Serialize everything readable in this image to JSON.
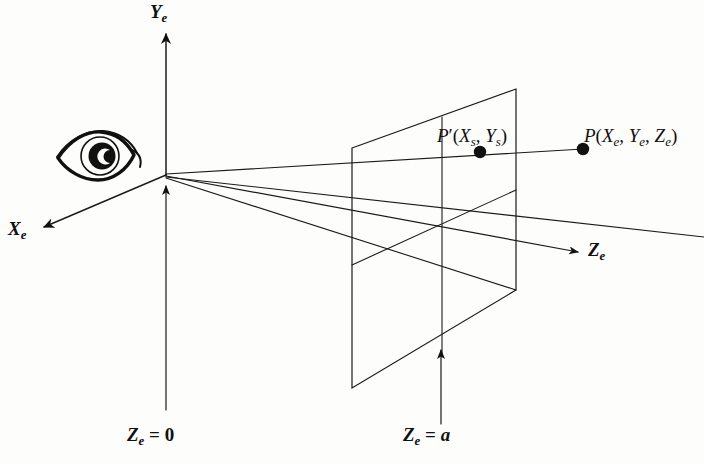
{
  "figure": {
    "background_color": "#fdfdfb",
    "ink_color": "#111111"
  },
  "axes": [
    {
      "id": "y-axis",
      "label_base": "Y",
      "label_sub": "e",
      "direction": "up",
      "arrow_from": [
        166,
        174
      ],
      "arrow_to": [
        166,
        30
      ],
      "label_pos": [
        152,
        4
      ]
    },
    {
      "id": "x-axis",
      "label_base": "X",
      "label_sub": "e",
      "direction": "down-left",
      "arrow_from": [
        166,
        174
      ],
      "arrow_to": [
        38,
        229
      ],
      "label_pos": [
        8,
        228
      ]
    },
    {
      "id": "z-axis",
      "label_base": "Z",
      "label_sub": "e",
      "direction": "right",
      "arrow_from": [
        166,
        176
      ],
      "arrow_to": [
        583,
        253
      ],
      "label_pos": [
        589,
        240
      ]
    }
  ],
  "origin": [
    166,
    175
  ],
  "eye": {
    "name": "eye-icon",
    "center": [
      96,
      157
    ],
    "width": 78,
    "height": 44
  },
  "points": [
    {
      "id": "p-projected",
      "label_base": "P",
      "prime": "′",
      "coords_open": "(",
      "coords": [
        "X",
        "Y"
      ],
      "subs": [
        "s",
        "s"
      ],
      "coords_close": ")",
      "full_text": "P′(Xs, Ys)",
      "dot": [
        480,
        152
      ],
      "label_pos": [
        437,
        127
      ]
    },
    {
      "id": "p-world",
      "label_base": "P",
      "prime": "",
      "coords_open": "(",
      "coords": [
        "X",
        "Y",
        "Z"
      ],
      "subs": [
        "e",
        "e",
        "e"
      ],
      "coords_close": ")",
      "full_text": "P(Xe, Ye, Ze)",
      "dot": [
        583,
        149
      ],
      "label_pos": [
        585,
        127
      ]
    }
  ],
  "plane_labels": [
    {
      "id": "plane-z0",
      "base": "Z",
      "sub": "e",
      "equals": "=",
      "value": "0",
      "full_text": "Ze = 0",
      "label_pos": [
        128,
        428
      ],
      "pointer_from": [
        166,
        410
      ],
      "pointer_to": [
        166,
        180
      ],
      "has_arrow": true
    },
    {
      "id": "plane-za",
      "base": "Z",
      "sub": "e",
      "equals": "=",
      "value": "a",
      "full_text": "Ze = a",
      "label_pos": [
        404,
        428
      ],
      "pointer_from": [
        441,
        424
      ],
      "pointer_to": [
        441,
        345
      ],
      "has_arrow": true
    }
  ],
  "projection_plane": {
    "id": "screen-plane",
    "corners": {
      "top_left": [
        352,
        148
      ],
      "top_right": [
        516,
        89
      ],
      "bottom_right": [
        516,
        290
      ],
      "bottom_left": [
        352,
        388
      ]
    },
    "interior_vertical": [
      [
        442,
        117
      ],
      [
        442,
        357
      ]
    ],
    "interior_horizontal": [
      [
        352,
        265
      ],
      [
        516,
        190
      ]
    ]
  },
  "rays": [
    {
      "id": "ray-upper",
      "from": [
        166,
        174
      ],
      "to": [
        583,
        149
      ],
      "description": "line of sight from eye origin through P' to P"
    },
    {
      "id": "ray-lower",
      "from": [
        166,
        177
      ],
      "to": [
        700,
        237
      ],
      "description": "lower viewing ray through plane"
    },
    {
      "id": "ray-frustum-lower",
      "from": [
        166,
        178
      ],
      "to": [
        516,
        290
      ],
      "description": "frustum edge to plane bottom-right"
    },
    {
      "id": "ray-frustum-bottom",
      "from": [
        352,
        388
      ],
      "to": [
        516,
        290
      ],
      "description": "plane bottom edge"
    }
  ]
}
